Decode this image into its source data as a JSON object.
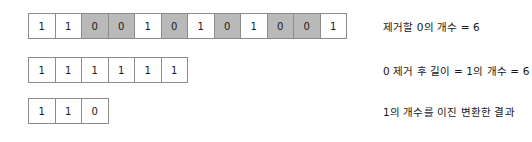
{
  "diagram": {
    "colors": {
      "cell_border": "#8c8c8c",
      "cell_fill_highlight": "#b9b9b9",
      "cell_fill_normal": "#ffffff",
      "text": "#161616",
      "background": "#ffffff"
    },
    "rows": [
      {
        "id": "row-original-binary",
        "cells": [
          {
            "value": "1",
            "highlighted": false
          },
          {
            "value": "1",
            "highlighted": false
          },
          {
            "value": "0",
            "highlighted": true
          },
          {
            "value": "0",
            "highlighted": true
          },
          {
            "value": "1",
            "highlighted": false
          },
          {
            "value": "0",
            "highlighted": true
          },
          {
            "value": "1",
            "highlighted": false
          },
          {
            "value": "0",
            "highlighted": true
          },
          {
            "value": "1",
            "highlighted": false
          },
          {
            "value": "0",
            "highlighted": true
          },
          {
            "value": "0",
            "highlighted": true
          },
          {
            "value": "1",
            "highlighted": false
          }
        ],
        "caption": "제거할 0의 개수 = 6"
      },
      {
        "id": "row-after-removal",
        "cells": [
          {
            "value": "1",
            "highlighted": false
          },
          {
            "value": "1",
            "highlighted": false
          },
          {
            "value": "1",
            "highlighted": false
          },
          {
            "value": "1",
            "highlighted": false
          },
          {
            "value": "1",
            "highlighted": false
          },
          {
            "value": "1",
            "highlighted": false
          }
        ],
        "caption": "0 제거 후 길이 = 1의 개수 = 6"
      },
      {
        "id": "row-binary-result",
        "cells": [
          {
            "value": "1",
            "highlighted": false
          },
          {
            "value": "1",
            "highlighted": false
          },
          {
            "value": "0",
            "highlighted": false
          }
        ],
        "caption": "1의 개수를 이진 변환한 결과"
      }
    ]
  }
}
